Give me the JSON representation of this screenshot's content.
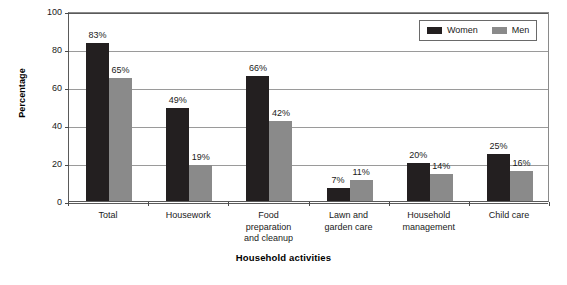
{
  "chart_data": {
    "type": "bar",
    "title": "",
    "subtitle": "",
    "xlabel": "Household activities",
    "ylabel": "Percentage",
    "ylim": [
      0,
      100
    ],
    "ytick_values": [
      0,
      20,
      40,
      60,
      80,
      100
    ],
    "ytick_labels": [
      "0",
      "20",
      "40",
      "60",
      "80",
      "100"
    ],
    "grid": true,
    "legend_position": "top-right",
    "value_suffix": "%",
    "categories": [
      "Total",
      "Housework",
      "Food preparation and cleanup",
      "Lawn and garden care",
      "Household management",
      "Child care"
    ],
    "category_label_lines": [
      [
        "Total"
      ],
      [
        "Housework"
      ],
      [
        "Food",
        "preparation",
        "and cleanup"
      ],
      [
        "Lawn and",
        "garden care"
      ],
      [
        "Household",
        "management"
      ],
      [
        "Child care"
      ]
    ],
    "series": [
      {
        "name": "Women",
        "color": "#231f20",
        "values": [
          83,
          49,
          66,
          7,
          20,
          25
        ],
        "labels": [
          "83%",
          "49%",
          "66%",
          "7%",
          "20%",
          "25%"
        ]
      },
      {
        "name": "Men",
        "color": "#8a8a8a",
        "values": [
          65,
          19,
          42,
          11,
          14,
          16
        ],
        "labels": [
          "65%",
          "19%",
          "42%",
          "11%",
          "14%",
          "16%"
        ]
      }
    ]
  },
  "legend": {
    "entries": [
      {
        "label": "Women",
        "color": "#231f20"
      },
      {
        "label": "Men",
        "color": "#8a8a8a"
      }
    ]
  }
}
